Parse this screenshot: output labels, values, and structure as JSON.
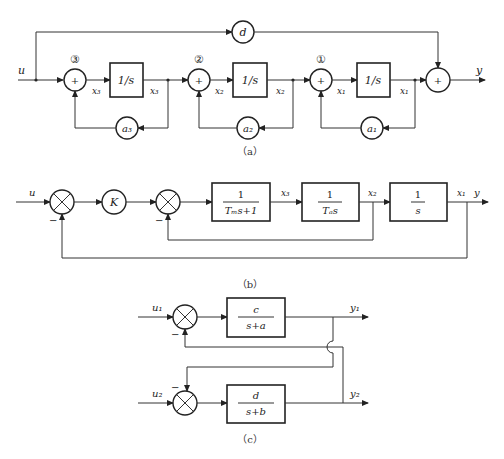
{
  "figure_a": {
    "caption": "（a）",
    "input": "u",
    "output": "y",
    "feedforward_gain": "d",
    "stage_labels": [
      "③",
      "②",
      "①"
    ],
    "sum_sign": "+",
    "integrator": "1/s",
    "signals": [
      "x₃",
      "x₃",
      "x₂",
      "x₂",
      "x₁",
      "x₁"
    ],
    "feedback_gains": [
      "a₃",
      "a₂",
      "a₁"
    ]
  },
  "figure_b": {
    "caption": "（b）",
    "input": "u",
    "output": "y",
    "gain": "K",
    "minus": "−",
    "block1": {
      "num": "1",
      "den": "Tₘs+1"
    },
    "block2": {
      "num": "1",
      "den": "Tₐs"
    },
    "block3": {
      "num": "1",
      "den": "s"
    },
    "signals": [
      "x₃",
      "x₂",
      "x₁"
    ]
  },
  "figure_c": {
    "caption": "（c）",
    "inputs": [
      "u₁",
      "u₂"
    ],
    "outputs": [
      "y₁",
      "y₂"
    ],
    "minus": "−",
    "block1": {
      "num": "c",
      "den": "s+a"
    },
    "block2": {
      "num": "d",
      "den": "s+b"
    }
  }
}
